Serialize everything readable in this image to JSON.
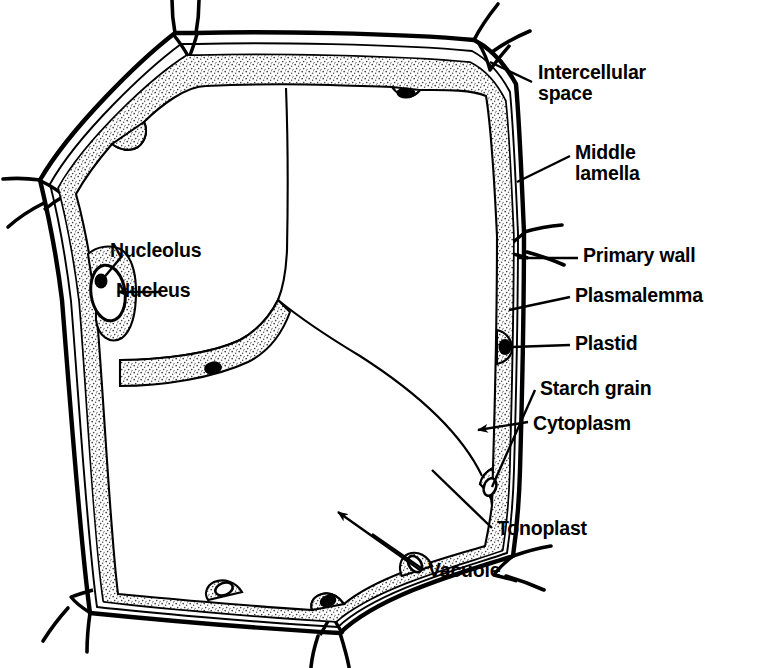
{
  "figure": {
    "domain": "diagram",
    "style": "black-and-white line drawing with stippled cytoplasm",
    "background_color": "#ffffff",
    "ink_color": "#000000",
    "stipple_color": "#555555"
  },
  "labels": [
    {
      "id": "intercellular-space",
      "line1": "Intercellular",
      "line2": "space",
      "x": 538,
      "y": 62,
      "leader": "line",
      "target": "top-right wall vertex triangle"
    },
    {
      "id": "middle-lamella",
      "line1": "Middle",
      "line2": "lamella",
      "x": 575,
      "y": 142,
      "leader": "line",
      "target": "thin line between adjacent primary walls"
    },
    {
      "id": "primary-wall",
      "line1": "Primary wall",
      "line2": "",
      "x": 583,
      "y": 245,
      "leader": "line",
      "target": "right wall outer layer"
    },
    {
      "id": "plasmalemma",
      "line1": "Plasmalemma",
      "line2": "",
      "x": 575,
      "y": 285,
      "leader": "line",
      "target": "membrane at inner face of wall"
    },
    {
      "id": "plastid",
      "line1": "Plastid",
      "line2": "",
      "x": 575,
      "y": 333,
      "leader": "line",
      "target": "dark oval body in cytoplasm"
    },
    {
      "id": "starch-grain",
      "line1": "Starch grain",
      "line2": "",
      "x": 540,
      "y": 378,
      "leader": "line",
      "target": "white oval inside plastid"
    },
    {
      "id": "cytoplasm",
      "line1": "Cytoplasm",
      "line2": "",
      "x": 533,
      "y": 413,
      "leader": "arrow",
      "target": "stippled peripheral layer and strands"
    },
    {
      "id": "nucleolus",
      "line1": "Nucleolus",
      "line2": "",
      "x": 110,
      "y": 240,
      "leader": "line",
      "target": "dark blob inside nucleus"
    },
    {
      "id": "nucleus",
      "line1": "Nucleus",
      "line2": "",
      "x": 116,
      "y": 280,
      "leader": "arrow",
      "target": "oval organelle in left cytoplasm bulge"
    },
    {
      "id": "tonoplast",
      "line1": "Tonoplast",
      "line2": "",
      "x": 497,
      "y": 518,
      "leader": "line",
      "target": "membrane bounding the vacuole"
    },
    {
      "id": "vacuole",
      "line1": "Vacuole",
      "line2": "",
      "x": 428,
      "y": 560,
      "leader": "arrow",
      "target": "large central clear space"
    }
  ],
  "structures": {
    "cell_outline": "irregular heptagon",
    "wall_layers": [
      "primary wall (outer)",
      "middle lamella (central thin line)",
      "primary wall (inner)"
    ],
    "intercellular_spaces": 7,
    "plastids_visible": 5,
    "starch_grains_visible": 3,
    "nucleus_count": 1,
    "nucleolus_count": 1,
    "cytoplasmic_strands": 3
  }
}
